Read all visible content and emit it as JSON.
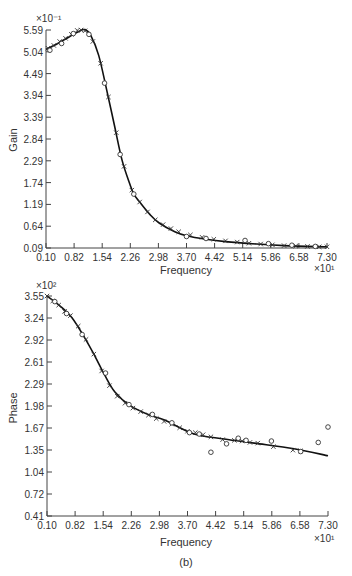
{
  "caption": "(b)",
  "chart_data": [
    {
      "type": "line",
      "title": "",
      "xlabel": "Frequency",
      "ylabel": "Gain",
      "x_multiplier": "×10¹",
      "y_multiplier": "×10⁻¹",
      "xlim": [
        0.1,
        7.3
      ],
      "ylim": [
        0.09,
        5.59
      ],
      "x_ticks": [
        "0.10",
        "0.82",
        "1.54",
        "2.26",
        "2.98",
        "3.70",
        "4.42",
        "5.14",
        "5.86",
        "6.58",
        "7.30"
      ],
      "y_ticks": [
        "0.09",
        "0.64",
        "1.19",
        "1.74",
        "2.29",
        "2.84",
        "3.39",
        "3.94",
        "4.49",
        "5.04",
        "5.59"
      ],
      "grid": false,
      "legend": null,
      "series": [
        {
          "name": "fitted curve",
          "style": "line",
          "x": [
            0.1,
            0.4,
            0.7,
            0.95,
            1.1,
            1.25,
            1.45,
            1.65,
            1.85,
            2.05,
            2.25,
            2.35,
            2.5,
            2.75,
            3.0,
            3.4,
            3.7,
            4.2,
            4.7,
            5.5,
            6.2,
            7.3
          ],
          "y": [
            5.1,
            5.25,
            5.42,
            5.56,
            5.6,
            5.45,
            4.95,
            4.1,
            3.2,
            2.3,
            1.7,
            1.45,
            1.25,
            0.95,
            0.72,
            0.5,
            0.4,
            0.31,
            0.25,
            0.19,
            0.15,
            0.12
          ]
        },
        {
          "name": "measured (×)",
          "style": "markers-x",
          "x": [
            0.15,
            0.3,
            0.45,
            0.6,
            0.75,
            0.9,
            1.0,
            1.1,
            1.3,
            1.5,
            1.7,
            1.9,
            2.1,
            2.3,
            2.5,
            2.7,
            2.9,
            3.1,
            3.3,
            3.5,
            3.8,
            4.1,
            4.4,
            4.7,
            5.0,
            5.3,
            5.6,
            5.9,
            6.2,
            6.5,
            6.8,
            7.1,
            7.3
          ],
          "y": [
            5.13,
            5.2,
            5.3,
            5.38,
            5.48,
            5.58,
            5.59,
            5.57,
            5.3,
            4.75,
            3.9,
            3.0,
            2.15,
            1.55,
            1.25,
            1.0,
            0.8,
            0.68,
            0.58,
            0.5,
            0.42,
            0.36,
            0.31,
            0.27,
            0.24,
            0.21,
            0.19,
            0.17,
            0.15,
            0.14,
            0.13,
            0.12,
            0.12
          ]
        },
        {
          "name": "measured (○)",
          "style": "markers-o",
          "x": [
            0.2,
            0.5,
            0.8,
            1.2,
            1.6,
            2.0,
            2.35,
            3.7,
            4.2,
            5.2,
            5.8,
            6.4,
            7.0
          ],
          "y": [
            5.08,
            5.25,
            5.5,
            5.48,
            4.25,
            2.45,
            1.45,
            0.38,
            0.33,
            0.28,
            0.2,
            0.16,
            0.13
          ]
        }
      ]
    },
    {
      "type": "line",
      "title": "",
      "xlabel": "Frequency",
      "ylabel": "Phase",
      "x_multiplier": "×10¹",
      "y_multiplier": "×10²",
      "xlim": [
        0.1,
        7.3
      ],
      "ylim": [
        0.41,
        3.55
      ],
      "x_ticks": [
        "0.10",
        "0.82",
        "1.54",
        "2.26",
        "2.98",
        "3.70",
        "4.42",
        "5.14",
        "5.86",
        "6.58",
        "7.30"
      ],
      "y_ticks": [
        "0.41",
        "0.72",
        "1.04",
        "1.35",
        "1.67",
        "1.98",
        "2.29",
        "2.61",
        "2.92",
        "3.24",
        "3.55"
      ],
      "grid": false,
      "legend": null,
      "series": [
        {
          "name": "fitted curve",
          "style": "line",
          "x": [
            0.1,
            0.43,
            0.74,
            1.07,
            1.33,
            1.58,
            1.84,
            2.22,
            2.73,
            3.11,
            3.87,
            4.64,
            5.41,
            6.43,
            7.3
          ],
          "y": [
            3.55,
            3.41,
            3.24,
            2.95,
            2.69,
            2.42,
            2.18,
            1.99,
            1.85,
            1.78,
            1.58,
            1.51,
            1.45,
            1.37,
            1.27
          ]
        },
        {
          "name": "measured (×)",
          "style": "markers-x",
          "x": [
            0.1,
            0.25,
            0.4,
            0.55,
            0.7,
            0.9,
            1.1,
            1.3,
            1.5,
            1.7,
            1.9,
            2.1,
            2.3,
            2.5,
            2.7,
            2.9,
            3.1,
            3.3,
            3.5,
            3.7,
            3.9,
            4.1,
            4.3,
            4.6,
            4.9,
            5.1,
            5.3,
            5.5,
            5.9,
            6.4,
            6.6
          ],
          "y": [
            3.55,
            3.48,
            3.42,
            3.33,
            3.27,
            3.12,
            2.93,
            2.72,
            2.48,
            2.27,
            2.12,
            2.02,
            1.95,
            1.9,
            1.85,
            1.8,
            1.76,
            1.72,
            1.67,
            1.62,
            1.6,
            1.57,
            1.54,
            1.5,
            1.49,
            1.48,
            1.46,
            1.45,
            1.4,
            1.35,
            1.34
          ]
        },
        {
          "name": "measured (○)",
          "style": "markers-o",
          "x": [
            0.3,
            0.6,
            1.0,
            1.6,
            2.2,
            2.8,
            3.3,
            3.75,
            4.0,
            4.3,
            4.7,
            5.0,
            5.2,
            5.85,
            6.6,
            7.05,
            7.3
          ],
          "y": [
            3.47,
            3.3,
            3.0,
            2.45,
            2.0,
            1.86,
            1.74,
            1.6,
            1.58,
            1.32,
            1.44,
            1.52,
            1.49,
            1.48,
            1.33,
            1.46,
            1.68
          ]
        }
      ]
    }
  ]
}
